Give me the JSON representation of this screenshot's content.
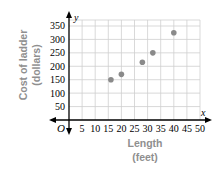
{
  "chart_data": {
    "type": "scatter",
    "title": "",
    "xlabel": "Length (feet)",
    "xlabel_lines": [
      "Length",
      "(feet)"
    ],
    "ylabel": "Cost of ladder (dollars)",
    "ylabel_lines": [
      "Cost of ladder",
      "(dollars)"
    ],
    "x_axis_symbol": "x",
    "y_axis_symbol": "y",
    "origin_label": "O",
    "xlim": [
      0,
      50
    ],
    "ylim": [
      0,
      350
    ],
    "x_ticks": [
      5,
      10,
      15,
      20,
      25,
      30,
      35,
      40,
      45,
      50
    ],
    "y_ticks": [
      50,
      100,
      150,
      200,
      250,
      300,
      350
    ],
    "grid": true,
    "legend": null,
    "points": [
      {
        "x": 16,
        "y": 150
      },
      {
        "x": 20,
        "y": 170
      },
      {
        "x": 28,
        "y": 215
      },
      {
        "x": 32,
        "y": 250
      },
      {
        "x": 40,
        "y": 325
      }
    ],
    "colors": {
      "point": "#8a8a8a",
      "grid": "#cfcfcf",
      "axis": "#000000",
      "axis_label": "#8f8f8f"
    }
  }
}
